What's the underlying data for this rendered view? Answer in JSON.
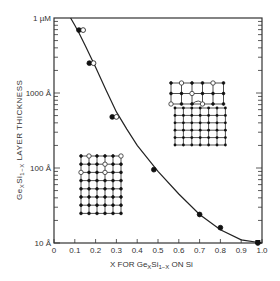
{
  "chart_data": {
    "type": "scatter",
    "title": "",
    "xlabel": "X FOR GeₓSi₁₋ₓ ON Si",
    "ylabel": "GeₓSi₁₋ₓ LAYER THICKNESS",
    "xlim": [
      0,
      1.0
    ],
    "ylim": [
      10,
      10000
    ],
    "yscale": "log",
    "grid": false,
    "x_ticks": [
      "0",
      "0.1",
      "0.2",
      "0.3",
      "0.4",
      "0.5",
      "0.6",
      "0.7",
      "0.8",
      "0.9",
      "1.0"
    ],
    "y_ticks": [
      {
        "value": 10,
        "label": "10 Å"
      },
      {
        "value": 100,
        "label": "100 Å"
      },
      {
        "value": 1000,
        "label": "1000 Å"
      },
      {
        "value": 10000,
        "label": "1 µM"
      }
    ],
    "series": [
      {
        "name": "filled points (measured)",
        "marker": "filled-circle",
        "x": [
          0.12,
          0.17,
          0.28,
          0.48,
          0.7,
          0.8,
          0.98
        ],
        "y": [
          6900,
          2500,
          480,
          95,
          24,
          16,
          10
        ]
      },
      {
        "name": "open points (measured)",
        "marker": "open-circle",
        "x": [
          0.14,
          0.19,
          0.3
        ],
        "y": [
          6900,
          2500,
          480
        ]
      },
      {
        "name": "critical thickness curve",
        "marker": "line",
        "x": [
          0.08,
          0.1,
          0.12,
          0.15,
          0.2,
          0.25,
          0.3,
          0.35,
          0.4,
          0.5,
          0.6,
          0.7,
          0.8,
          0.9,
          1.0
        ],
        "y": [
          10000,
          8000,
          6300,
          4300,
          2200,
          1100,
          560,
          330,
          200,
          90,
          45,
          24,
          15,
          11,
          10
        ]
      }
    ],
    "annotations": [
      {
        "type": "inset-diagram",
        "description": "strained lattice, coherent interface (open circles = Ge atoms)",
        "position": "lower-left"
      },
      {
        "type": "inset-diagram",
        "description": "relaxed lattice with misfit dislocation",
        "position": "upper-right"
      }
    ],
    "legend": "none"
  },
  "axes": {
    "x_title_prefix": "X FOR Ge",
    "x_title_sub1": "X",
    "x_title_mid": "Si",
    "x_title_sub2": "1−X",
    "x_title_suffix": " ON Si",
    "y_title_prefix": "Ge",
    "y_title_sub1": "X",
    "y_title_mid": "Si",
    "y_title_sub2": "1−X",
    "y_title_suffix": " LAYER THICKNESS"
  }
}
